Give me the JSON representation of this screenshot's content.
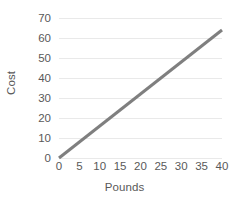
{
  "chart_data": {
    "type": "line",
    "title": "",
    "xlabel": "Pounds",
    "ylabel": "Cost",
    "xlim": [
      0,
      40
    ],
    "ylim": [
      0,
      70
    ],
    "xticks": [
      0,
      5,
      10,
      15,
      20,
      25,
      30,
      35,
      40
    ],
    "ytick_labels": [
      "0",
      "10",
      "20",
      "30",
      "40",
      "50",
      "60",
      "70"
    ],
    "yticks": [
      0,
      10,
      20,
      30,
      40,
      50,
      60,
      70
    ],
    "grid": "horizontal",
    "legend": "none",
    "series": [
      {
        "name": "Cost vs Pounds",
        "color": "#7f7f7f",
        "line_width": 3,
        "x": [
          0,
          40
        ],
        "values": [
          0,
          64
        ],
        "slope_per_pound": 1.6
      }
    ]
  },
  "axes": {
    "y_title": "Cost",
    "x_title": "Pounds"
  },
  "colors": {
    "line": "#7f7f7f",
    "gridline": "#e9e9e9",
    "text": "#595959",
    "background": "#ffffff"
  }
}
